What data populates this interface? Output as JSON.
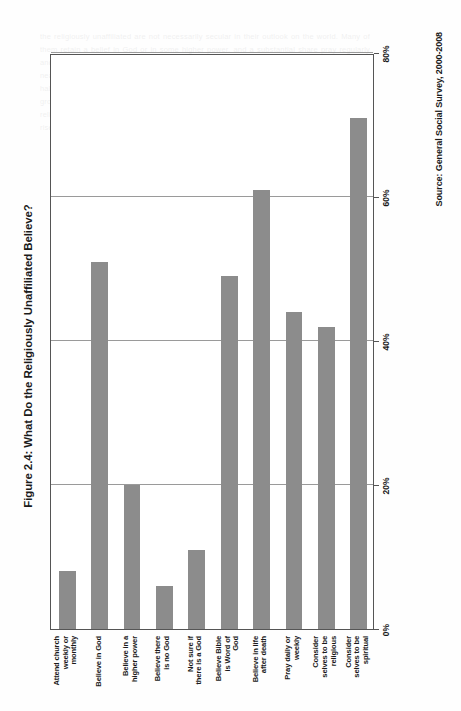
{
  "figure": {
    "title": "Figure 2.4: What Do the Religiously Unaffiliated Believe?",
    "source": "Source: General Social Survey, 2000-2008"
  },
  "chart_data": {
    "type": "bar",
    "orientation": "horizontal",
    "title": "Figure 2.4: What Do the Religiously Unaffiliated Believe?",
    "source": "Source: General Social Survey, 2000-2008",
    "xlabel": "",
    "ylabel": "",
    "categories": [
      "Attend church weekly or monthly",
      "Believe in God",
      "Believe in a higher power",
      "Believe there is no God",
      "Not sure if there is a God",
      "Believe Bible is Word of God",
      "Believe in life after death",
      "Pray daily or weekly",
      "Consider selves to be religious",
      "Consider selves to be spiritual"
    ],
    "category_lines": [
      [
        "Attend church",
        "weekly or",
        "monthly"
      ],
      [
        "Believe in God"
      ],
      [
        "Believe in a",
        "higher power"
      ],
      [
        "Believe there",
        "is no God"
      ],
      [
        "Not sure if",
        "there is a God"
      ],
      [
        "Believe Bible",
        "is Word of God"
      ],
      [
        "Believe in life",
        "after death"
      ],
      [
        "Pray daily or",
        "weekly"
      ],
      [
        "Consider",
        "selves to be",
        "religious"
      ],
      [
        "Consider",
        "selves to be",
        "spiritual"
      ]
    ],
    "values": [
      8,
      51,
      20,
      6,
      11,
      49,
      61,
      44,
      42,
      71
    ],
    "value_labels": [
      "8%",
      "51%",
      "20%",
      "6%",
      "11%",
      "49%",
      "61%",
      "44%",
      "42%",
      "71%"
    ],
    "xlim": [
      0,
      80
    ],
    "ticks": [
      0,
      20,
      40,
      60,
      80
    ],
    "tick_labels": [
      "0%",
      "20%",
      "40%",
      "60%",
      "80%"
    ],
    "grid": true,
    "legend": false,
    "bar_color": "#8c8c8c",
    "axis_color": "#555555",
    "grid_color": "#9a9a9a"
  },
  "background_text": "the religiously unaffiliated are not necessarily secular in their outlook on the world. Many of them retain a belief in God or in some higher power, and a substantial share pray regularly and consider themselves spiritual people. The survey evidence gathered over the course of nearly a decade shows that a majority continue to believe in life after death and that roughly half believe the Bible is in some sense the word of God. What appears to distinguish this group is not a rejection of belief as such but rather a reluctance to identify with any particular religious tradition or institution. Observers who equate the growth of the unaffiliated with the rise of secularism therefore risk misreading the data in important ways."
}
